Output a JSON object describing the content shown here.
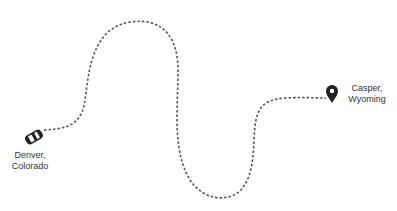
{
  "route": {
    "origin": {
      "city": "Denver,",
      "region": "Colorado",
      "icon": "car-icon"
    },
    "destination": {
      "city": "Casper,",
      "region": "Wyoming",
      "icon": "map-pin-icon"
    },
    "line_color": "#555555",
    "line_style": "dotted"
  }
}
